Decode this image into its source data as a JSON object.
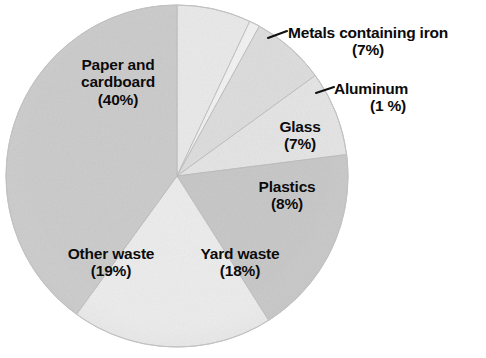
{
  "chart_data": {
    "type": "pie",
    "title": "",
    "subtitle": "",
    "xlabel": "",
    "ylabel": "",
    "legend_position": "none",
    "grid": false,
    "units": "percent",
    "start_angle_deg": 0,
    "direction": "clockwise",
    "categories": [
      "Metals containing iron",
      "Aluminum",
      "Glass",
      "Plastics",
      "Yard waste",
      "Other waste",
      "Paper and cardboard"
    ],
    "values": [
      7,
      1,
      7,
      8,
      18,
      19,
      40
    ],
    "slices": [
      {
        "name": "Metals containing iron",
        "label": "Metals containing iron",
        "value": 7,
        "pct_text": "(7%)",
        "color": "#e9e9e9",
        "label_placement": "outside",
        "leader_line": true
      },
      {
        "name": "Aluminum",
        "label": "Aluminum",
        "value": 1,
        "pct_text": "(1 %)",
        "color": "#f2f2f2",
        "label_placement": "outside",
        "leader_line": true
      },
      {
        "name": "Glass",
        "label": "Glass",
        "value": 7,
        "pct_text": "(7%)",
        "color": "#dcdcdc",
        "label_placement": "inside",
        "leader_line": false
      },
      {
        "name": "Plastics",
        "label": "Plastics",
        "value": 8,
        "pct_text": "(8%)",
        "color": "#e4e4e4",
        "label_placement": "inside",
        "leader_line": false
      },
      {
        "name": "Yard waste",
        "label": "Yard waste",
        "value": 18,
        "pct_text": "(18%)",
        "color": "#c6c6c6",
        "label_placement": "inside",
        "leader_line": false
      },
      {
        "name": "Other waste",
        "label": "Other waste",
        "value": 19,
        "pct_text": "(19%)",
        "color": "#ececec",
        "label_placement": "inside",
        "leader_line": false
      },
      {
        "name": "Paper and cardboard",
        "label": "Paper and cardboard",
        "label_line1": "Paper and",
        "label_line2": "cardboard",
        "value": 40,
        "pct_text": "(40%)",
        "color": "#cacaca",
        "label_placement": "inside",
        "leader_line": false
      }
    ],
    "colors": {
      "background": "#ffffff",
      "text": "#0b0b0b",
      "slice_outline": "#b8b8b8",
      "leader_line": "#111111"
    }
  }
}
